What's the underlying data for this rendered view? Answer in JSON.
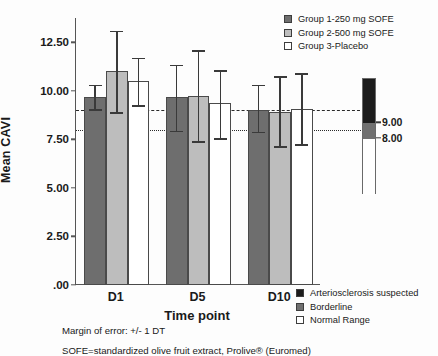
{
  "chart_data": {
    "type": "bar",
    "title": "",
    "xlabel": "Time point",
    "ylabel": "Mean CAVI",
    "categories": [
      "D1",
      "D5",
      "D10"
    ],
    "ylim": [
      0,
      13.75
    ],
    "yticks": [
      ".00",
      "2.50",
      "5.00",
      "7.50",
      "10.00",
      "12.50"
    ],
    "ytick_values": [
      0,
      2.5,
      5.0,
      7.5,
      10.0,
      12.5
    ],
    "grid": false,
    "legend_position": "top-right",
    "error_note": "Margin of error: +/- 1 DT",
    "series": [
      {
        "name": "Group 1-250 mg SOFE",
        "color": "#6e6e6e",
        "values": [
          9.7,
          9.7,
          9.0
        ],
        "err_low": [
          9.05,
          7.95,
          7.9
        ],
        "err_high": [
          10.3,
          11.35,
          10.3
        ]
      },
      {
        "name": "Group 2-500 mg SOFE",
        "color": "#bdbdbd",
        "values": [
          11.0,
          9.75,
          8.9
        ],
        "err_low": [
          8.9,
          7.4,
          7.15
        ],
        "err_high": [
          13.1,
          12.1,
          10.75
        ]
      },
      {
        "name": "Group 3-Placebo",
        "color": "#ffffff",
        "values": [
          10.5,
          9.35,
          9.05
        ],
        "err_low": [
          9.25,
          7.55,
          7.25
        ],
        "err_high": [
          11.7,
          11.05,
          10.9
        ]
      }
    ],
    "reference_lines": [
      {
        "label": "9.00",
        "value": 9.0,
        "style": "dashed"
      },
      {
        "label": "8.00",
        "value": 8.0,
        "style": "dotted"
      }
    ],
    "reference_scale": {
      "top_value": 11.85,
      "bottom_value": 4.4,
      "segments": [
        {
          "name": "Arteriosclerosis suspected",
          "color": "#1c1c1c",
          "from": 9.0,
          "to": 11.85
        },
        {
          "name": "Borderline",
          "color": "#707070",
          "from": 8.0,
          "to": 9.0
        },
        {
          "name": "Normal Range",
          "color": "#ffffff",
          "from": 4.4,
          "to": 8.0
        }
      ],
      "tick_labels": [
        "9.00",
        "8.00"
      ],
      "tick_values": [
        9.0,
        8.0
      ]
    }
  },
  "legend_groups": {
    "items": [
      {
        "label": "Group 1-250 mg SOFE",
        "color": "#6e6e6e"
      },
      {
        "label": "Group 2-500 mg SOFE",
        "color": "#bdbdbd"
      },
      {
        "label": "Group 3-Placebo",
        "color": "#ffffff"
      }
    ]
  },
  "legend_ranges": {
    "items": [
      {
        "label": "Arteriosclerosis suspected",
        "color": "#1c1c1c"
      },
      {
        "label": "Borderline",
        "color": "#707070"
      },
      {
        "label": "Normal Range",
        "color": "#ffffff"
      }
    ]
  },
  "footnotes": {
    "margin_of_error": "Margin of error: +/- 1 DT",
    "sofe_definition": "SOFE=standardized olive fruit extract, Prolive® (Euromed)"
  }
}
